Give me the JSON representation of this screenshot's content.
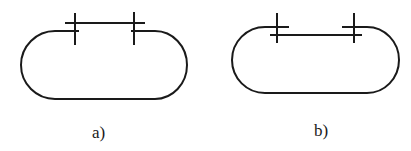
{
  "figure": {
    "stroke_color": "#1a1a1a",
    "background": "#ffffff",
    "panels": [
      {
        "id": "a",
        "label": "a)",
        "description": "Stadium-shaped closed loop with an upper bar spanning above the top edge, joined by two cross ticks"
      },
      {
        "id": "b",
        "label": "b)",
        "description": "Stadium-shaped closed loop with a bar spanning just below the top edge, joined by two cross ticks"
      }
    ]
  }
}
